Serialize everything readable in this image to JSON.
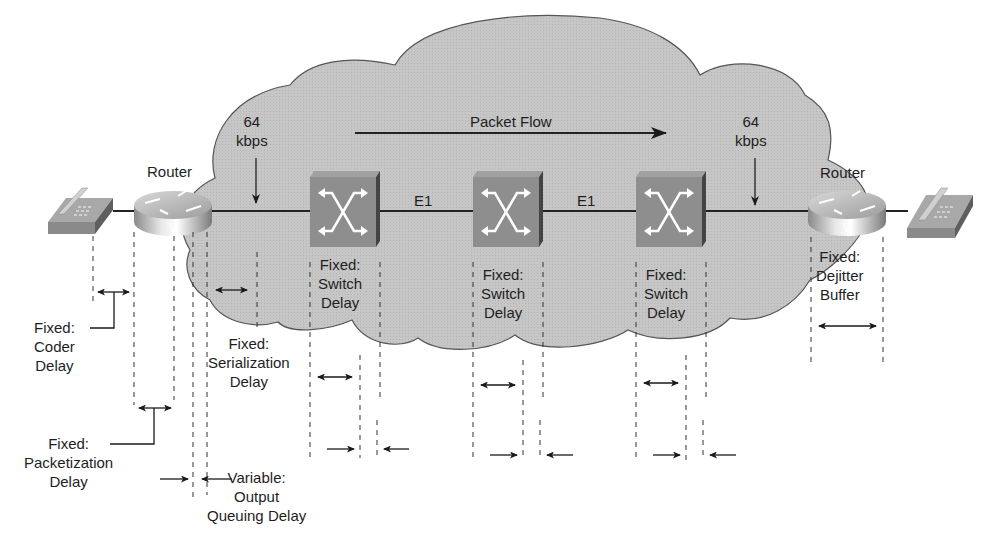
{
  "title": "Packet Flow",
  "colors": {
    "cloud_fill": "#c4c4c4",
    "cloud_stroke": "#555555",
    "switch_front": "#8f8f8f",
    "switch_side": "#4a4a4a",
    "line": "#222222"
  },
  "nodes": {
    "left_phone": {
      "type": "ip-phone"
    },
    "left_router": {
      "label": "Router",
      "badge": "V"
    },
    "switch_1": {
      "type": "atm-switch"
    },
    "switch_2": {
      "type": "atm-switch"
    },
    "switch_3": {
      "type": "atm-switch"
    },
    "right_router": {
      "label": "Router",
      "badge": "V"
    },
    "right_phone": {
      "type": "ip-phone"
    }
  },
  "links": {
    "left_speed": {
      "line1": "64",
      "line2": "kbps"
    },
    "right_speed": {
      "line1": "64",
      "line2": "kbps"
    },
    "trunk_1": "E1",
    "trunk_2": "E1"
  },
  "delays": {
    "coder": {
      "line1": "Fixed:",
      "line2": "Coder",
      "line3": "Delay"
    },
    "packetization": {
      "line1": "Fixed:",
      "line2": "Packetization",
      "line3": "Delay"
    },
    "queuing": {
      "line1": "Variable:",
      "line2": "Output",
      "line3": "Queuing Delay"
    },
    "serialization": {
      "line1": "Fixed:",
      "line2": "Serialization",
      "line3": "Delay"
    },
    "switch_1": {
      "line1": "Fixed:",
      "line2": "Switch",
      "line3": "Delay"
    },
    "switch_2": {
      "line1": "Fixed:",
      "line2": "Switch",
      "line3": "Delay"
    },
    "switch_3": {
      "line1": "Fixed:",
      "line2": "Switch",
      "line3": "Delay"
    },
    "dejitter": {
      "line1": "Fixed:",
      "line2": "Dejitter",
      "line3": "Buffer"
    }
  }
}
